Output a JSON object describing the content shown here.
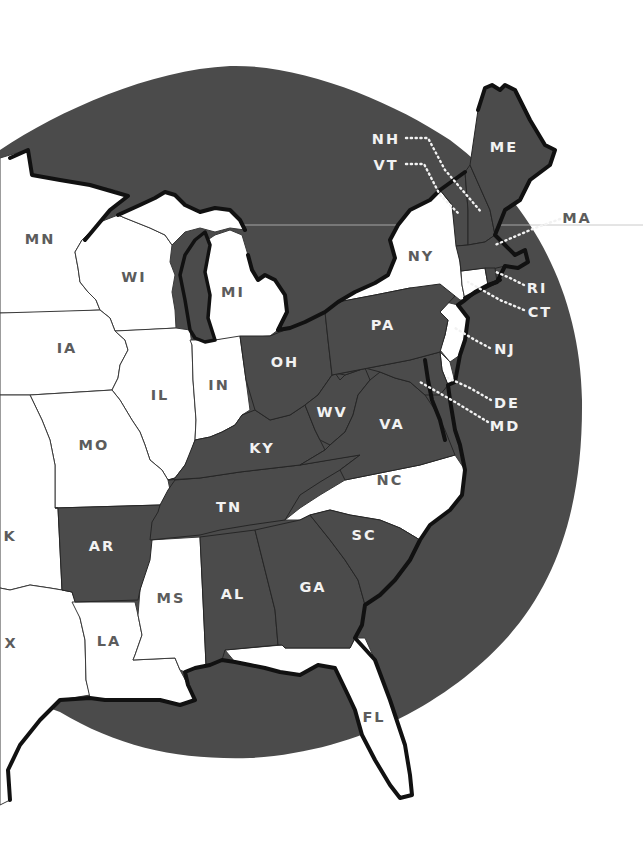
{
  "map": {
    "type": "choropleth-two-tone",
    "region": "Eastern United States",
    "colors": {
      "highlighted_fill": "#4b4b4b",
      "unhighlighted_fill": "#ffffff",
      "background_sea_circle": "#4b4b4b",
      "label_on_light": "#5c5c5c",
      "label_on_dark": "#f2f2f2",
      "coastline": "#111111"
    },
    "states": {
      "MN": {
        "label": "MN",
        "highlighted": false
      },
      "WI": {
        "label": "WI",
        "highlighted": false
      },
      "MI": {
        "label": "MI",
        "highlighted": false
      },
      "IA": {
        "label": "IA",
        "highlighted": false
      },
      "IL": {
        "label": "IL",
        "highlighted": false
      },
      "IN": {
        "label": "IN",
        "highlighted": false
      },
      "MO": {
        "label": "MO",
        "highlighted": false
      },
      "OK": {
        "label": "K",
        "highlighted": false
      },
      "TX": {
        "label": "X",
        "highlighted": false
      },
      "AR": {
        "label": "AR",
        "highlighted": true
      },
      "LA": {
        "label": "LA",
        "highlighted": false
      },
      "MS": {
        "label": "MS",
        "highlighted": false
      },
      "AL": {
        "label": "AL",
        "highlighted": true
      },
      "GA": {
        "label": "GA",
        "highlighted": true
      },
      "FL": {
        "label": "FL",
        "highlighted": false
      },
      "SC": {
        "label": "SC",
        "highlighted": true
      },
      "NC": {
        "label": "NC",
        "highlighted": false
      },
      "TN": {
        "label": "TN",
        "highlighted": true
      },
      "KY": {
        "label": "KY",
        "highlighted": true
      },
      "OH": {
        "label": "OH",
        "highlighted": true
      },
      "WV": {
        "label": "WV",
        "highlighted": true
      },
      "VA": {
        "label": "VA",
        "highlighted": true
      },
      "PA": {
        "label": "PA",
        "highlighted": true
      },
      "NY": {
        "label": "NY",
        "highlighted": false
      },
      "NJ": {
        "label": "NJ",
        "highlighted": false
      },
      "DE": {
        "label": "DE",
        "highlighted": false
      },
      "MD": {
        "label": "MD",
        "highlighted": true
      },
      "CT": {
        "label": "CT",
        "highlighted": false
      },
      "RI": {
        "label": "RI",
        "highlighted": true
      },
      "MA": {
        "label": "MA",
        "highlighted": true
      },
      "VT": {
        "label": "VT",
        "highlighted": true
      },
      "NH": {
        "label": "NH",
        "highlighted": true
      },
      "ME": {
        "label": "ME",
        "highlighted": true
      }
    },
    "callout_labels": [
      "NH",
      "VT",
      "MA",
      "RI",
      "CT",
      "NJ",
      "DE",
      "MD"
    ]
  }
}
